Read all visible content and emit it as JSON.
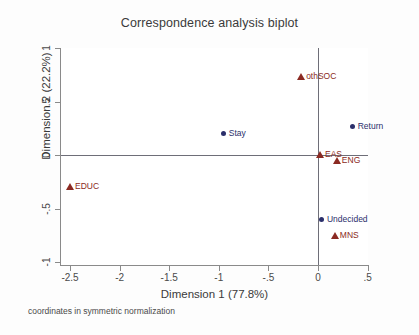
{
  "chart_data": {
    "type": "scatter",
    "title": "Correspondence analysis biplot",
    "xlabel": "Dimension 1 (77.8%)",
    "ylabel": "Dimension 2 (22.2%)",
    "footnote": "coordinates in symmetric normalization",
    "xlim": [
      -2.6,
      0.6
    ],
    "ylim": [
      -1.09,
      1.09
    ],
    "xticks": [
      "-2.5",
      "-2",
      "-1.5",
      "-1",
      "-.5",
      "0",
      ".5"
    ],
    "xtick_values": [
      -2.5,
      -2,
      -1.5,
      -1,
      -0.5,
      0,
      0.5
    ],
    "yticks": [
      "1",
      ".5",
      "0",
      "-.5",
      "-1"
    ],
    "ytick_values": [
      1,
      0.5,
      0,
      -0.5,
      -1
    ],
    "grid": false,
    "legend": "none",
    "reference_lines": {
      "x": 0,
      "y": 0
    },
    "colors": {
      "dimension_1_points": "#2b2f6b",
      "dimension_2_points": "#8b2a22"
    },
    "series": [
      {
        "name": "dimension 1 (row) categories",
        "marker": "circle",
        "color": "#2b2f6b",
        "points": [
          {
            "label": "Stay",
            "x": -0.95,
            "y": 0.2,
            "label_side": "right"
          },
          {
            "label": "Return",
            "x": 0.35,
            "y": 0.26,
            "label_side": "right"
          },
          {
            "label": "Undecided",
            "x": 0.04,
            "y": -0.61,
            "label_side": "right"
          }
        ]
      },
      {
        "name": "dimension 2 (column) categories",
        "marker": "triangle",
        "color": "#8b2a22",
        "points": [
          {
            "label": "othSOC",
            "x": -0.17,
            "y": 0.73,
            "label_side": "right"
          },
          {
            "label": "EAS",
            "x": 0.02,
            "y": 0.0,
            "label_side": "right"
          },
          {
            "label": "ENG",
            "x": 0.19,
            "y": -0.06,
            "label_side": "right"
          },
          {
            "label": "EDUC",
            "x": -2.5,
            "y": -0.3,
            "label_side": "right"
          },
          {
            "label": "MNS",
            "x": 0.17,
            "y": -0.76,
            "label_side": "right"
          }
        ]
      }
    ]
  }
}
